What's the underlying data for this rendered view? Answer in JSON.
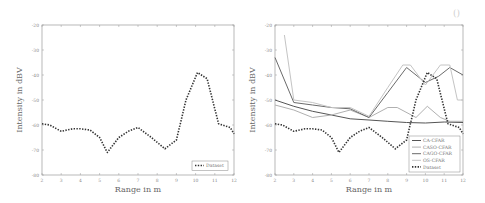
{
  "corner_mark": "()",
  "chart_data": [
    {
      "type": "line",
      "title": "",
      "xlabel": "Range in m",
      "ylabel": "Intensity in dBV",
      "xlim": [
        2,
        12
      ],
      "ylim": [
        -80,
        -20
      ],
      "xticks": [
        "2",
        "3",
        "4",
        "5",
        "6",
        "7",
        "8",
        "9",
        "10",
        "11",
        "12"
      ],
      "yticks": [
        "-20",
        "-30",
        "-40",
        "-50",
        "-60",
        "-70",
        "-80"
      ],
      "grid": false,
      "legend_position": "lower right",
      "series": [
        {
          "name": "Dataset",
          "style": "dotted",
          "color": "#333333",
          "x": [
            2,
            2.4,
            3,
            3.6,
            4,
            4.5,
            5,
            5.4,
            6,
            6.5,
            7,
            7.7,
            8.4,
            9,
            9.5,
            10.1,
            10.6,
            11.2,
            11.8,
            12
          ],
          "y": [
            -59.5,
            -60,
            -62.5,
            -61.5,
            -61.5,
            -62,
            -65,
            -71,
            -65,
            -62.5,
            -61,
            -65,
            -69.5,
            -66,
            -50,
            -39,
            -41.5,
            -59.5,
            -61,
            -63.5
          ]
        }
      ]
    },
    {
      "type": "line",
      "title": "",
      "xlabel": "Range in m",
      "ylabel": "Intensity in dBV",
      "xlim": [
        2,
        12
      ],
      "ylim": [
        -80,
        -20
      ],
      "xticks": [
        "2",
        "3",
        "4",
        "5",
        "6",
        "7",
        "8",
        "9",
        "10",
        "11",
        "12"
      ],
      "yticks": [
        "-20",
        "-30",
        "-40",
        "-50",
        "-60",
        "-70",
        "-80"
      ],
      "grid": false,
      "legend_position": "lower right",
      "series": [
        {
          "name": "CA-CFAR",
          "style": "solid",
          "color": "#555555",
          "x": [
            2,
            3,
            4,
            5,
            6,
            7,
            8,
            9,
            10,
            11,
            12
          ],
          "y": [
            -50,
            -52.5,
            -54.5,
            -56,
            -57.5,
            -58,
            -58.5,
            -59,
            -59.2,
            -58.8,
            -59
          ]
        },
        {
          "name": "CASO-CFAR",
          "style": "solid",
          "color": "#b0b0b0",
          "x": [
            2,
            3,
            4,
            5,
            6,
            7,
            8,
            8.5,
            9.5,
            10.1,
            10.8,
            11.3,
            12
          ],
          "y": [
            -52,
            -54,
            -57,
            -56,
            -54,
            -57,
            -53,
            -53,
            -57,
            -52.5,
            -57,
            -58.5,
            -58.5
          ]
        },
        {
          "name": "CAGO-CFAR",
          "style": "solid",
          "color": "#6a6a6a",
          "x": [
            2,
            3,
            4,
            5,
            6,
            7,
            8,
            9,
            10,
            10.7,
            11.3,
            12
          ],
          "y": [
            -33,
            -51,
            -52,
            -53,
            -53.5,
            -57,
            -47,
            -37,
            -43,
            -40.5,
            -37,
            -40
          ]
        },
        {
          "name": "OS-CFAR",
          "style": "solid",
          "color": "#c4c4c4",
          "x": [
            2.5,
            3,
            4,
            5,
            6,
            7,
            8,
            8.8,
            9.2,
            10,
            10.8,
            11.3,
            11.7,
            12
          ],
          "y": [
            -24,
            -50,
            -51,
            -53,
            -53,
            -56.5,
            -45,
            -36,
            -36,
            -44,
            -36,
            -36,
            -50,
            -50
          ]
        },
        {
          "name": "Dataset",
          "style": "dotted",
          "color": "#333333",
          "x": [
            2,
            2.4,
            3,
            3.6,
            4,
            4.5,
            5,
            5.4,
            6,
            6.5,
            7,
            7.7,
            8.4,
            9,
            9.5,
            10.1,
            10.6,
            11.2,
            11.8,
            12
          ],
          "y": [
            -59.5,
            -60,
            -62.5,
            -61.5,
            -61.5,
            -62,
            -65,
            -71,
            -65,
            -62.5,
            -61,
            -65,
            -69.5,
            -66,
            -50,
            -39,
            -41.5,
            -59.5,
            -61,
            -63.5
          ]
        }
      ]
    }
  ]
}
